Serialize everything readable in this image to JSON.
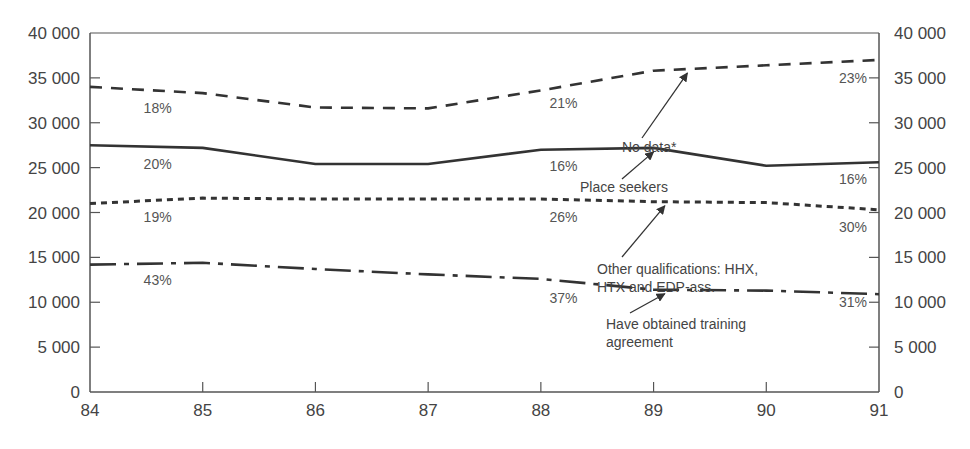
{
  "chart_data": {
    "type": "line",
    "title": "",
    "xlabel": "",
    "ylabel": "",
    "x": [
      84,
      85,
      86,
      87,
      88,
      89,
      90,
      91
    ],
    "xlim": [
      84,
      91
    ],
    "ylim": [
      0,
      40000
    ],
    "yticks": [
      0,
      5000,
      10000,
      15000,
      20000,
      25000,
      30000,
      35000,
      40000
    ],
    "ytick_labels": [
      "0",
      "5 000",
      "10 000",
      "15 000",
      "20 000",
      "25 000",
      "30 000",
      "35 000",
      "40 000"
    ],
    "xtick_labels": [
      "84",
      "85",
      "86",
      "87",
      "88",
      "89",
      "90",
      "91"
    ],
    "grid": false,
    "dual_y_axis": true,
    "series": [
      {
        "name": "No data*",
        "style": "dashed",
        "values": [
          34000,
          33300,
          31700,
          31600,
          33600,
          35800,
          36400,
          37000
        ],
        "percent_labels": [
          {
            "x": 84.6,
            "text": "18%"
          },
          {
            "x": 88.2,
            "text": "21%"
          },
          {
            "x": 91,
            "text": "23%"
          }
        ]
      },
      {
        "name": "Place seekers",
        "style": "solid",
        "values": [
          27500,
          27200,
          25400,
          25400,
          27000,
          27200,
          25200,
          25600
        ],
        "percent_labels": [
          {
            "x": 84.6,
            "text": "20%"
          },
          {
            "x": 88.2,
            "text": "16%"
          },
          {
            "x": 91,
            "text": "16%"
          }
        ]
      },
      {
        "name": "Other qualifications: HHX, HTX and EDP-ass.",
        "style": "dotted",
        "values": [
          21000,
          21600,
          21500,
          21500,
          21500,
          21200,
          21100,
          20300
        ],
        "percent_labels": [
          {
            "x": 84.6,
            "text": "19%"
          },
          {
            "x": 88.2,
            "text": "26%"
          },
          {
            "x": 91,
            "text": "30%"
          }
        ]
      },
      {
        "name": "Have obtained training agreement",
        "style": "dash-dot",
        "values": [
          14200,
          14400,
          13700,
          13100,
          12600,
          11400,
          11300,
          10900
        ],
        "percent_labels": [
          {
            "x": 84.6,
            "text": "43%"
          },
          {
            "x": 88.2,
            "text": "37%"
          },
          {
            "x": 91,
            "text": "31%"
          }
        ]
      }
    ],
    "annotations": [
      {
        "series": "No data*",
        "lines": [
          "No data*"
        ]
      },
      {
        "series": "Place seekers",
        "lines": [
          "Place seekers"
        ]
      },
      {
        "series": "Other qualifications: HHX, HTX and EDP-ass.",
        "lines": [
          "Other qualifications: HHX,",
          "HTX and EDP-ass."
        ]
      },
      {
        "series": "Have obtained training agreement",
        "lines": [
          "Have obtained training",
          "agreement"
        ]
      }
    ],
    "colors": {
      "line": "#333333",
      "axis": "#555555",
      "text": "#444444"
    }
  }
}
